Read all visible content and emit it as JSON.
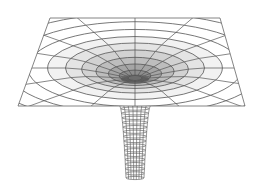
{
  "figure": {
    "background": "#ffffff",
    "line_color": "#555555",
    "shade_colors": [
      "#f2f2f2",
      "#e4e4e4",
      "#d2d2d2",
      "#bdbdbd",
      "#a5a5a5",
      "#8e8e8e"
    ],
    "plane": {
      "top_left": [
        50,
        18
      ],
      "top_right": [
        220,
        18
      ],
      "bottom_right": [
        245,
        106
      ],
      "bottom_left": [
        18,
        106
      ]
    },
    "center": [
      135,
      68
    ],
    "rings": 12,
    "radial_lines": 16,
    "tube": {
      "top_y": 104,
      "bottom_y": 178,
      "top_half_width": 16,
      "bottom_half_width": 9,
      "rings": 16,
      "columns": 7
    }
  }
}
